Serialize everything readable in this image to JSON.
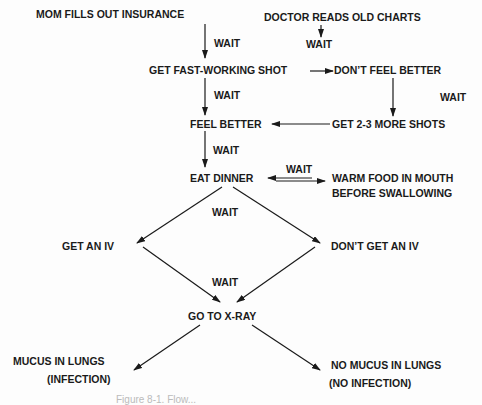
{
  "nodes": {
    "mom_insurance": "MOM FILLS OUT INSURANCE",
    "doctor_charts": "DOCTOR READS OLD CHARTS",
    "fast_shot": "GET FAST-WORKING SHOT",
    "dont_feel_better": "DON’T FEEL BETTER",
    "feel_better": "FEEL BETTER",
    "more_shots": "GET 2-3 MORE SHOTS",
    "eat_dinner": "EAT DINNER",
    "warm_food_1": "WARM FOOD IN MOUTH",
    "warm_food_2": "BEFORE SWALLOWING",
    "get_iv": "GET AN IV",
    "dont_get_iv": "DON’T GET AN IV",
    "xray": "GO TO X-RAY",
    "mucus_1": "MUCUS IN LUNGS",
    "mucus_2": "(INFECTION)",
    "no_mucus_1": "NO MUCUS IN LUNGS",
    "no_mucus_2": "(NO INFECTION)"
  },
  "edge_labels": {
    "wait": "WAIT"
  },
  "caption": "Figure 8-1. Flow..."
}
